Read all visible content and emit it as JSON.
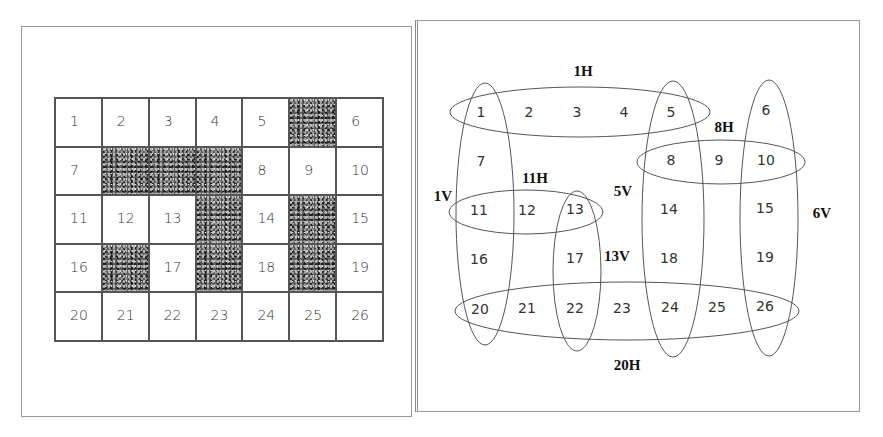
{
  "left_panel": {
    "title": "Crossword grid",
    "rows": 5,
    "cols": 7,
    "cells": [
      {
        "label": "1",
        "shaded": false
      },
      {
        "label": "2",
        "shaded": false
      },
      {
        "label": "3",
        "shaded": false
      },
      {
        "label": "4",
        "shaded": false
      },
      {
        "label": "5",
        "shaded": false
      },
      {
        "label": "",
        "shaded": true
      },
      {
        "label": "6",
        "shaded": false
      },
      {
        "label": "7",
        "shaded": false
      },
      {
        "label": "",
        "shaded": true
      },
      {
        "label": "",
        "shaded": true
      },
      {
        "label": "",
        "shaded": true
      },
      {
        "label": "8",
        "shaded": false
      },
      {
        "label": "9",
        "shaded": false
      },
      {
        "label": "10",
        "shaded": false
      },
      {
        "label": "11",
        "shaded": false
      },
      {
        "label": "12",
        "shaded": false
      },
      {
        "label": "13",
        "shaded": false
      },
      {
        "label": "",
        "shaded": true
      },
      {
        "label": "14",
        "shaded": false
      },
      {
        "label": "",
        "shaded": true
      },
      {
        "label": "15",
        "shaded": false
      },
      {
        "label": "16",
        "shaded": false
      },
      {
        "label": "",
        "shaded": true
      },
      {
        "label": "17",
        "shaded": false
      },
      {
        "label": "",
        "shaded": true
      },
      {
        "label": "18",
        "shaded": false
      },
      {
        "label": "",
        "shaded": true
      },
      {
        "label": "19",
        "shaded": false
      },
      {
        "label": "20",
        "shaded": false
      },
      {
        "label": "21",
        "shaded": false
      },
      {
        "label": "22",
        "shaded": false
      },
      {
        "label": "23",
        "shaded": false
      },
      {
        "label": "24",
        "shaded": false
      },
      {
        "label": "25",
        "shaded": false
      },
      {
        "label": "26",
        "shaded": false
      }
    ]
  },
  "right_panel": {
    "title": "Word slots as variable groups",
    "numbers": [
      {
        "label": "1",
        "x": 481,
        "y": 112
      },
      {
        "label": "2",
        "x": 529,
        "y": 112
      },
      {
        "label": "3",
        "x": 577,
        "y": 112
      },
      {
        "label": "4",
        "x": 624,
        "y": 112
      },
      {
        "label": "5",
        "x": 671,
        "y": 112
      },
      {
        "label": "6",
        "x": 766,
        "y": 110
      },
      {
        "label": "7",
        "x": 481,
        "y": 161
      },
      {
        "label": "8",
        "x": 671,
        "y": 160
      },
      {
        "label": "9",
        "x": 719,
        "y": 160
      },
      {
        "label": "10",
        "x": 766,
        "y": 160
      },
      {
        "label": "11",
        "x": 479,
        "y": 210
      },
      {
        "label": "12",
        "x": 527,
        "y": 210
      },
      {
        "label": "13",
        "x": 575,
        "y": 209
      },
      {
        "label": "14",
        "x": 669,
        "y": 209
      },
      {
        "label": "15",
        "x": 765,
        "y": 208
      },
      {
        "label": "16",
        "x": 479,
        "y": 259
      },
      {
        "label": "17",
        "x": 575,
        "y": 258
      },
      {
        "label": "18",
        "x": 669,
        "y": 258
      },
      {
        "label": "19",
        "x": 765,
        "y": 257
      },
      {
        "label": "20",
        "x": 480,
        "y": 309
      },
      {
        "label": "21",
        "x": 527,
        "y": 308
      },
      {
        "label": "22",
        "x": 575,
        "y": 308
      },
      {
        "label": "23",
        "x": 622,
        "y": 308
      },
      {
        "label": "24",
        "x": 670,
        "y": 307
      },
      {
        "label": "25",
        "x": 717,
        "y": 307
      },
      {
        "label": "26",
        "x": 765,
        "y": 306
      }
    ],
    "slots": [
      {
        "label": "1H",
        "label_x": 583,
        "label_y": 71,
        "cx": 580,
        "cy": 112,
        "rx": 130,
        "ry": 25,
        "cells": [
          "1",
          "2",
          "3",
          "4",
          "5"
        ]
      },
      {
        "label": "8H",
        "label_x": 724,
        "label_y": 127,
        "cx": 721,
        "cy": 162,
        "rx": 84,
        "ry": 22,
        "cells": [
          "8",
          "9",
          "10"
        ]
      },
      {
        "label": "11H",
        "label_x": 535,
        "label_y": 178,
        "cx": 526,
        "cy": 212,
        "rx": 77,
        "ry": 22,
        "cells": [
          "11",
          "12",
          "13"
        ]
      },
      {
        "label": "20H",
        "label_x": 627,
        "label_y": 365,
        "cx": 627,
        "cy": 311,
        "rx": 172,
        "ry": 29,
        "cells": [
          "20",
          "21",
          "22",
          "23",
          "24",
          "25",
          "26"
        ]
      },
      {
        "label": "1V",
        "label_x": 443,
        "label_y": 196,
        "cx": 485,
        "cy": 214,
        "rx": 29,
        "ry": 131,
        "cells": [
          "1",
          "7",
          "11",
          "16",
          "20"
        ]
      },
      {
        "label": "5V",
        "label_x": 623,
        "label_y": 191,
        "cx": 673,
        "cy": 219,
        "rx": 31,
        "ry": 138,
        "cells": [
          "5",
          "8",
          "14",
          "18",
          "24"
        ]
      },
      {
        "label": "6V",
        "label_x": 822,
        "label_y": 213,
        "cx": 769,
        "cy": 218,
        "rx": 29,
        "ry": 138,
        "cells": [
          "6",
          "10",
          "15",
          "19",
          "26"
        ]
      },
      {
        "label": "13V",
        "label_x": 617,
        "label_y": 256,
        "cx": 577,
        "cy": 271,
        "rx": 24,
        "ry": 80,
        "cells": [
          "13",
          "17",
          "22"
        ]
      }
    ]
  },
  "colors": {
    "line": "#555555",
    "frame": "#9a9a9a",
    "text": "#333333",
    "shaded": "#5a5a5a"
  }
}
